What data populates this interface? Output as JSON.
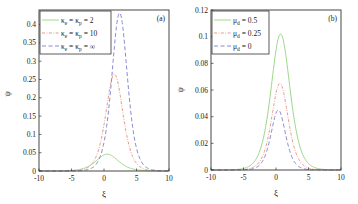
{
  "chart_data": [
    {
      "panel": "a",
      "type": "line",
      "title": "",
      "panel_label": "(a)",
      "xlabel": "ξ",
      "ylabel": "ψ",
      "xlim": [
        -10,
        10
      ],
      "ylim": [
        0,
        0.44
      ],
      "xticks": [
        -10,
        -5,
        0,
        5,
        10
      ],
      "yticks": [
        0,
        0.05,
        0.1,
        0.15,
        0.2,
        0.25,
        0.3,
        0.35,
        0.4
      ],
      "ytick_labels": [
        "0",
        "0.05",
        "0.1",
        "0.15",
        "0.2",
        "0.25",
        "0.3",
        "0.35",
        "0.4"
      ],
      "grid": false,
      "legend_position": "upper left",
      "series": [
        {
          "name": "κe = κp = 2",
          "label_main": "κ",
          "sub1": "e",
          "mid": " = κ",
          "sub2": "p",
          "tail": " = 2",
          "style": "solid",
          "color": "#9ed88a",
          "amplitude": 0.046,
          "center": 0.5,
          "width": 2.3
        },
        {
          "name": "κe = κp = 10",
          "label_main": "κ",
          "sub1": "e",
          "mid": " = κ",
          "sub2": "p",
          "tail": " = 10",
          "style": "dashdot",
          "color": "#e89a8a",
          "amplitude": 0.265,
          "center": 1.6,
          "width": 1.75
        },
        {
          "name": "κe = κp = ∞",
          "label_main": "κ",
          "sub1": "e",
          "mid": " = κ",
          "sub2": "p",
          "tail": " = ∞",
          "style": "dashed",
          "color": "#8a8ad0",
          "amplitude": 0.432,
          "center": 2.4,
          "width": 1.6
        }
      ]
    },
    {
      "panel": "b",
      "type": "line",
      "title": "",
      "panel_label": "(b)",
      "xlabel": "ξ",
      "ylabel": "ψ",
      "xlim": [
        -10,
        10
      ],
      "ylim": [
        0,
        0.12
      ],
      "xticks": [
        -10,
        -5,
        0,
        5,
        10
      ],
      "yticks": [
        0,
        0.02,
        0.04,
        0.06,
        0.08,
        0.1,
        0.12
      ],
      "ytick_labels": [
        "0",
        "0.02",
        "0.04",
        "0.06",
        "0.08",
        "0.1",
        "0.12"
      ],
      "grid": false,
      "legend_position": "upper left",
      "series": [
        {
          "name": "μd = 0.5",
          "label_main": "μ",
          "sub1": "d",
          "tail": " = 0.5",
          "style": "solid",
          "color": "#9ed88a",
          "amplitude": 0.102,
          "center": 0.7,
          "width": 1.95
        },
        {
          "name": "μd = 0.25",
          "label_main": "μ",
          "sub1": "d",
          "tail": " = 0.25",
          "style": "dashdot",
          "color": "#e89a8a",
          "amplitude": 0.065,
          "center": 0.6,
          "width": 1.7
        },
        {
          "name": "μd = 0",
          "label_main": "μ",
          "sub1": "d",
          "tail": " = 0",
          "style": "dashed",
          "color": "#8a8ad0",
          "amplitude": 0.045,
          "center": 0.35,
          "width": 1.5
        }
      ]
    }
  ]
}
